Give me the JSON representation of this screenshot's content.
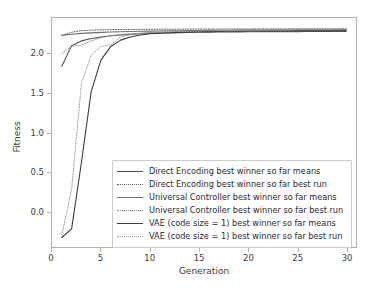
{
  "chart_data": {
    "type": "line",
    "title": "",
    "xlabel": "Generation",
    "ylabel": "Fitness",
    "xlim": [
      0,
      31
    ],
    "ylim": [
      -0.45,
      2.45
    ],
    "xticks": [
      "0",
      "5",
      "10",
      "15",
      "20",
      "25",
      "30"
    ],
    "xtick_values": [
      0,
      5,
      10,
      15,
      20,
      25,
      30
    ],
    "yticks": [
      "0.0",
      "0.5",
      "1.0",
      "1.5",
      "2.0"
    ],
    "ytick_values": [
      0.0,
      0.5,
      1.0,
      1.5,
      2.0
    ],
    "grid": false,
    "legend_position": "lower right",
    "x": [
      1,
      2,
      3,
      4,
      5,
      6,
      7,
      8,
      9,
      10,
      11,
      12,
      13,
      14,
      15,
      16,
      17,
      18,
      19,
      20,
      21,
      22,
      23,
      24,
      25,
      26,
      27,
      28,
      29,
      30
    ],
    "series": [
      {
        "name": "Direct Encoding best winner so far means",
        "style": "solid",
        "color": "#4d4d4d",
        "values": [
          1.84,
          2.1,
          2.16,
          2.19,
          2.21,
          2.225,
          2.235,
          2.243,
          2.25,
          2.255,
          2.259,
          2.262,
          2.265,
          2.267,
          2.269,
          2.271,
          2.272,
          2.273,
          2.274,
          2.275,
          2.276,
          2.277,
          2.277,
          2.278,
          2.278,
          2.279,
          2.279,
          2.28,
          2.28,
          2.281
        ]
      },
      {
        "name": "Direct Encoding best winner so far best run",
        "style": "dotted",
        "color": "#5a5a5a",
        "values": [
          2.23,
          2.27,
          2.29,
          2.295,
          2.3,
          2.302,
          2.304,
          2.305,
          2.306,
          2.307,
          2.308,
          2.308,
          2.309,
          2.309,
          2.31,
          2.31,
          2.31,
          2.311,
          2.311,
          2.311,
          2.312,
          2.312,
          2.312,
          2.312,
          2.313,
          2.313,
          2.313,
          2.313,
          2.314,
          2.314
        ]
      },
      {
        "name": "Universal Controller best winner so far means",
        "style": "solid",
        "color": "#6e6e6e",
        "values": [
          2.23,
          2.245,
          2.255,
          2.262,
          2.268,
          2.272,
          2.276,
          2.279,
          2.282,
          2.284,
          2.286,
          2.288,
          2.289,
          2.291,
          2.292,
          2.293,
          2.294,
          2.295,
          2.296,
          2.297,
          2.297,
          2.298,
          2.299,
          2.299,
          2.3,
          2.3,
          2.301,
          2.301,
          2.302,
          2.302
        ]
      },
      {
        "name": "Universal Controller best winner so far best run",
        "style": "dotted",
        "color": "#8a8a8a",
        "values": [
          2.0,
          2.095,
          2.105,
          2.16,
          2.2,
          2.225,
          2.24,
          2.25,
          2.258,
          2.264,
          2.268,
          2.272,
          2.275,
          2.277,
          2.279,
          2.281,
          2.283,
          2.284,
          2.285,
          2.286,
          2.287,
          2.288,
          2.289,
          2.289,
          2.29,
          2.291,
          2.291,
          2.292,
          2.292,
          2.293
        ]
      },
      {
        "name": "VAE (code size = 1) best winner so far means",
        "style": "solid",
        "color": "#3c3c3c",
        "values": [
          -0.33,
          -0.22,
          0.62,
          1.52,
          1.92,
          2.09,
          2.17,
          2.21,
          2.235,
          2.25,
          2.258,
          2.264,
          2.268,
          2.272,
          2.275,
          2.278,
          2.28,
          2.282,
          2.283,
          2.285,
          2.286,
          2.287,
          2.288,
          2.289,
          2.29,
          2.29,
          2.291,
          2.292,
          2.292,
          2.293
        ]
      },
      {
        "name": "VAE (code size = 1) best winner so far best run",
        "style": "dotted",
        "color": "#9a9a9a",
        "values": [
          -0.3,
          0.28,
          1.62,
          1.98,
          2.09,
          2.11,
          2.21,
          2.24,
          2.255,
          2.265,
          2.272,
          2.277,
          2.281,
          2.284,
          2.286,
          2.288,
          2.29,
          2.291,
          2.292,
          2.293,
          2.294,
          2.295,
          2.296,
          2.296,
          2.297,
          2.298,
          2.298,
          2.299,
          2.299,
          2.3
        ]
      }
    ]
  }
}
